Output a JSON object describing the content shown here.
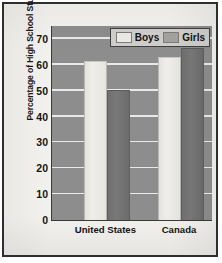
{
  "chart_data": {
    "type": "bar",
    "title": "",
    "subtitle": "",
    "xlabel": "",
    "ylabel": "Percentage of High School Students",
    "categories": [
      "United States",
      "Canada"
    ],
    "series": [
      {
        "name": "Boys",
        "values": [
          61,
          62.5
        ],
        "color": "#eceae6"
      },
      {
        "name": "Girls",
        "values": [
          50,
          66
        ],
        "color": "#a3a29e"
      }
    ],
    "ylim": [
      0,
      75
    ],
    "yticks": [
      0,
      10,
      20,
      30,
      40,
      50,
      60,
      70
    ],
    "ytick_labels": [
      "0",
      "10",
      "20",
      "30",
      "40",
      "50",
      "60",
      "70"
    ],
    "grid": "horizontal",
    "legend_position": "top-right",
    "plot_background_color": "#8d8d8d",
    "gridline_color": "#e9e9e9",
    "frame_color": "#2e2e2e",
    "page_background_color": "#f2f1ed"
  },
  "legend": {
    "entries": [
      {
        "label": "Boys",
        "swatch": "boys-swatch"
      },
      {
        "label": "Girls",
        "swatch": "girls-swatch"
      }
    ]
  }
}
